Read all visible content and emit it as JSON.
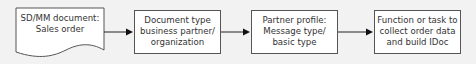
{
  "diagram": {
    "nodes": [
      {
        "id": "sales-order-document",
        "shape": "document",
        "lines": [
          "SD/MM document:",
          "Sales order"
        ]
      },
      {
        "id": "document-type",
        "shape": "rectangle",
        "lines": [
          "Document type",
          "business partner/",
          "organization"
        ]
      },
      {
        "id": "partner-profile",
        "shape": "rectangle",
        "lines": [
          "Partner profile:",
          "Message type/",
          "basic type"
        ]
      },
      {
        "id": "function-task",
        "shape": "rectangle",
        "lines": [
          "Function or task to",
          "collect order data",
          "and build IDoc"
        ]
      }
    ],
    "edges": [
      {
        "from": "sales-order-document",
        "to": "document-type"
      },
      {
        "from": "document-type",
        "to": "partner-profile"
      },
      {
        "from": "partner-profile",
        "to": "function-task"
      }
    ]
  }
}
